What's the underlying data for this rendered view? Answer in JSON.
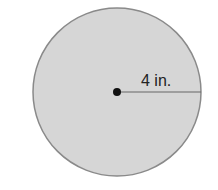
{
  "diagram": {
    "shape": "circle",
    "radius_label": "4 in.",
    "radius_value": 4,
    "unit": "in.",
    "colors": {
      "fill": "#d6d6d6",
      "stroke": "#8a8a8a",
      "radius_line": "#666666",
      "center_dot": "#111111"
    }
  }
}
